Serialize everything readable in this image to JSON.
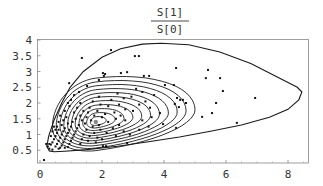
{
  "chart_data": {
    "type": "scatter",
    "title": {
      "numerator": "S[1]",
      "denominator": "S[0]"
    },
    "xlabel": "",
    "ylabel": "",
    "xlim": [
      0,
      8.7
    ],
    "ylim": [
      0.1,
      4
    ],
    "x_ticks": [
      0,
      2,
      4,
      6,
      8
    ],
    "x_tick_labels": [
      "0",
      "2",
      "4",
      "6",
      "8"
    ],
    "y_ticks": [
      0.5,
      1,
      1.5,
      2,
      2.5,
      3,
      3.5,
      4
    ],
    "y_tick_labels": [
      "0.5",
      "1",
      "1.5",
      "2",
      "2.5",
      "3",
      "3.5",
      "4"
    ],
    "grid": false,
    "legend": null,
    "overlay": "density contour lines (nested, ~12 levels) with mode near (1.8, 1.4)",
    "contours": [
      {
        "level": 1,
        "left_tip": [
          0.3,
          0.48
        ],
        "top": [
          3.9,
          3.9
        ],
        "right": [
          8.45,
          2.4
        ],
        "bottom_right": [
          8.0,
          1.45
        ]
      },
      {
        "level": 2,
        "left_tip": [
          0.45,
          0.55
        ],
        "top": [
          2.9,
          2.73
        ],
        "right": [
          4.9,
          1.97
        ]
      },
      {
        "level": 3,
        "left_tip": [
          0.5,
          0.58
        ],
        "top": [
          2.6,
          2.44
        ],
        "right": [
          4.03,
          1.75
        ]
      },
      {
        "level": 4,
        "left_tip": [
          0.55,
          0.6
        ],
        "top": [
          2.4,
          2.19
        ],
        "right": [
          3.6,
          1.6
        ]
      }
    ],
    "mode_point": [
      1.8,
      1.4
    ],
    "series": [
      {
        "name": "samples",
        "points": [
          [
            5.42,
            3.05
          ],
          [
            5.35,
            2.79
          ],
          [
            5.81,
            2.79
          ],
          [
            5.9,
            2.38
          ],
          [
            6.94,
            2.16
          ],
          [
            5.68,
            2.0
          ],
          [
            5.55,
            1.68
          ],
          [
            5.23,
            1.56
          ],
          [
            6.35,
            1.37
          ],
          [
            4.39,
            3.11
          ],
          [
            4.03,
            2.57
          ],
          [
            4.32,
            2.57
          ],
          [
            3.68,
            2.25
          ],
          [
            4.42,
            2.16
          ],
          [
            4.52,
            2.1
          ],
          [
            4.61,
            2.1
          ],
          [
            4.71,
            2.0
          ],
          [
            4.35,
            1.97
          ],
          [
            4.48,
            1.87
          ],
          [
            3.87,
            1.68
          ],
          [
            3.97,
            1.33
          ],
          [
            4.39,
            1.21
          ],
          [
            2.29,
            3.68
          ],
          [
            3.06,
            3.49
          ],
          [
            3.19,
            3.49
          ],
          [
            2.03,
            2.95
          ],
          [
            2.06,
            2.86
          ],
          [
            2.61,
            2.95
          ],
          [
            2.81,
            2.98
          ],
          [
            3.35,
            2.86
          ],
          [
            3.52,
            2.86
          ],
          [
            1.35,
            3.43
          ],
          [
            0.94,
            2.63
          ],
          [
            1.9,
            2.73
          ],
          [
            2.1,
            2.92
          ],
          [
            1.26,
            2.35
          ],
          [
            1.52,
            2.54
          ],
          [
            0.13,
            0.19
          ],
          [
            2.03,
            0.63
          ],
          [
            2.13,
            0.63
          ],
          [
            2.81,
            0.73
          ],
          [
            3.1,
            2.45
          ],
          [
            3.3,
            2.35
          ],
          [
            2.95,
            2.2
          ],
          [
            3.4,
            2.05
          ],
          [
            3.2,
            1.95
          ],
          [
            3.55,
            1.85
          ],
          [
            3.0,
            1.75
          ],
          [
            3.6,
            1.55
          ],
          [
            3.3,
            1.45
          ],
          [
            3.5,
            1.25
          ],
          [
            3.2,
            1.15
          ],
          [
            2.9,
            1.0
          ],
          [
            2.5,
            2.3
          ],
          [
            2.7,
            2.15
          ],
          [
            2.3,
            2.1
          ],
          [
            2.55,
            1.95
          ],
          [
            2.2,
            1.9
          ],
          [
            2.75,
            1.8
          ],
          [
            2.4,
            1.7
          ],
          [
            2.6,
            1.6
          ],
          [
            2.1,
            1.65
          ],
          [
            2.45,
            1.5
          ],
          [
            2.75,
            1.45
          ],
          [
            2.2,
            1.4
          ],
          [
            2.55,
            1.3
          ],
          [
            2.35,
            1.2
          ],
          [
            2.7,
            1.1
          ],
          [
            2.15,
            1.05
          ],
          [
            2.45,
            0.95
          ],
          [
            2.0,
            0.85
          ],
          [
            1.9,
            2.2
          ],
          [
            1.7,
            2.05
          ],
          [
            1.95,
            1.95
          ],
          [
            1.6,
            1.85
          ],
          [
            1.85,
            1.75
          ],
          [
            1.55,
            1.7
          ],
          [
            1.75,
            1.6
          ],
          [
            2.0,
            1.55
          ],
          [
            1.5,
            1.55
          ],
          [
            1.65,
            1.45
          ],
          [
            1.9,
            1.3
          ],
          [
            1.45,
            1.35
          ],
          [
            1.7,
            1.25
          ],
          [
            1.95,
            1.15
          ],
          [
            1.5,
            1.15
          ],
          [
            1.75,
            1.05
          ],
          [
            1.4,
            1.0
          ],
          [
            1.6,
            0.95
          ],
          [
            1.85,
            0.9
          ],
          [
            1.35,
            0.85
          ],
          [
            1.55,
            0.8
          ],
          [
            1.8,
            0.75
          ],
          [
            1.3,
            0.7
          ],
          [
            1.3,
            2.0
          ],
          [
            1.2,
            1.85
          ],
          [
            1.4,
            1.75
          ],
          [
            1.1,
            1.7
          ],
          [
            1.3,
            1.6
          ],
          [
            1.15,
            1.5
          ],
          [
            1.35,
            1.45
          ],
          [
            1.05,
            1.4
          ],
          [
            1.25,
            1.3
          ],
          [
            1.0,
            1.25
          ],
          [
            1.2,
            1.2
          ],
          [
            0.95,
            1.15
          ],
          [
            1.15,
            1.1
          ],
          [
            0.9,
            1.05
          ],
          [
            1.1,
            1.0
          ],
          [
            0.85,
            0.95
          ],
          [
            1.05,
            0.9
          ],
          [
            0.8,
            0.85
          ],
          [
            1.0,
            0.8
          ],
          [
            0.75,
            0.75
          ],
          [
            0.95,
            0.7
          ],
          [
            0.7,
            0.65
          ],
          [
            0.9,
            0.6
          ],
          [
            0.65,
            0.58
          ],
          [
            0.85,
            1.55
          ],
          [
            0.75,
            1.45
          ],
          [
            0.9,
            1.35
          ],
          [
            0.7,
            1.3
          ],
          [
            0.8,
            1.2
          ],
          [
            0.6,
            1.15
          ],
          [
            0.75,
            1.1
          ],
          [
            0.55,
            1.05
          ],
          [
            0.7,
            1.0
          ],
          [
            0.5,
            0.95
          ],
          [
            0.65,
            0.9
          ],
          [
            0.45,
            0.85
          ],
          [
            0.6,
            0.8
          ],
          [
            0.4,
            0.75
          ],
          [
            0.55,
            0.7
          ],
          [
            0.35,
            0.68
          ],
          [
            0.5,
            0.62
          ],
          [
            0.3,
            0.7
          ],
          [
            0.45,
            1.25
          ],
          [
            0.4,
            1.1
          ],
          [
            0.6,
            1.4
          ],
          [
            0.35,
            0.95
          ],
          [
            0.55,
            1.25
          ],
          [
            0.5,
            1.15
          ],
          [
            0.95,
            1.9
          ],
          [
            0.8,
            1.75
          ],
          [
            1.0,
            2.1
          ],
          [
            0.65,
            1.6
          ],
          [
            1.1,
            2.25
          ],
          [
            0.9,
            2.0
          ],
          [
            0.25,
            0.62
          ],
          [
            0.2,
            0.7
          ],
          [
            0.3,
            0.55
          ],
          [
            0.4,
            0.52
          ],
          [
            0.6,
            0.55
          ],
          [
            0.8,
            0.58
          ]
        ]
      }
    ]
  }
}
